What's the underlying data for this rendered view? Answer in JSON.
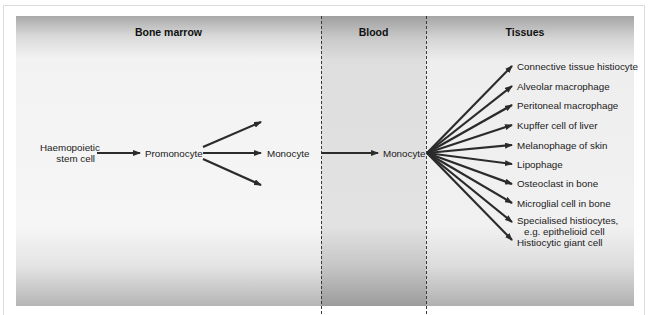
{
  "regions": {
    "bone_marrow": "Bone marrow",
    "blood": "Blood",
    "tissues": "Tissues"
  },
  "nodes": {
    "stem_cell_line1": "Haemopoietic",
    "stem_cell_line2": "stem cell",
    "promonocyte": "Promonocyte",
    "monocyte_marrow": "Monocyte",
    "monocyte_blood": "Monocyte"
  },
  "tissue_cells": [
    "Connective tissue histiocyte",
    "Alveolar macrophage",
    "Peritoneal macrophage",
    "Kupffer cell of liver",
    "Melanophage of skin",
    "Lipophage",
    "Osteoclast in bone",
    "Microglial cell in bone",
    "Specialised histiocytes,",
    "e.g. epithelioid cell",
    "Histiocytic giant cell"
  ],
  "colors": {
    "arrow": "#2b2b2b",
    "blood_panel": "#e2e2e2",
    "side_panel": "#f3f3f3"
  }
}
